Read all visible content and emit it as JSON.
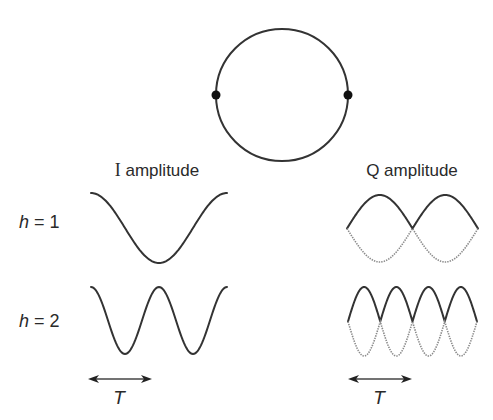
{
  "diagram": {
    "circle": {
      "cx": 282,
      "cy": 95,
      "r": 66,
      "markers": [
        {
          "name": "left-point",
          "x": 216,
          "y": 95
        },
        {
          "name": "right-point",
          "x": 348,
          "y": 95
        }
      ]
    },
    "columns": {
      "i": {
        "title_prefix": "I",
        "title_suffix": " amplitude",
        "title_x": 157,
        "title_y": 176
      },
      "q": {
        "title": "Q amplitude",
        "title_x": 412,
        "title_y": 176
      }
    },
    "rows": [
      {
        "label_var": "h",
        "label_rest": " = 1",
        "h": 1,
        "label_y": 228,
        "i_wave": {
          "x0": 91,
          "x1": 227,
          "top": 193,
          "bottom": 263
        },
        "q_wave": {
          "x0": 347,
          "x1": 478,
          "top": 195,
          "bottom": 262
        }
      },
      {
        "label_var": "h",
        "label_rest": " = 2",
        "h": 2,
        "label_y": 327,
        "i_wave": {
          "x0": 91,
          "x1": 227,
          "top": 287,
          "bottom": 354
        },
        "q_wave": {
          "x0": 348,
          "x1": 477,
          "top": 287,
          "bottom": 356
        }
      }
    ],
    "period_arrows": [
      {
        "side": "I",
        "x0": 88,
        "x1": 152,
        "y": 379,
        "label": "T",
        "label_x": 119,
        "label_y": 404
      },
      {
        "side": "Q",
        "x0": 348,
        "x1": 412,
        "y": 379,
        "label": "T",
        "label_x": 379,
        "label_y": 404
      }
    ],
    "colors": {
      "stroke": "#333333",
      "dotted": "#8a8a8a",
      "text": "#2a2a2a"
    }
  }
}
